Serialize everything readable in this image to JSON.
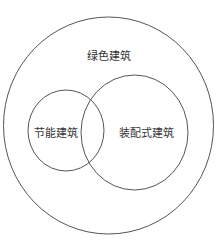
{
  "diagram": {
    "type": "venn",
    "outer": {
      "label": "绿色建筑",
      "cx": 108.5,
      "cy": 125.5,
      "rx": 105,
      "ry": 108.5,
      "label_x": 109,
      "label_y": 55
    },
    "left": {
      "label": "节能建筑",
      "cx": 66,
      "cy": 130.5,
      "rx": 38,
      "ry": 40.5,
      "label_x": 56,
      "label_y": 132
    },
    "right": {
      "label": "装配式建筑",
      "cx": 134.5,
      "cy": 132.5,
      "rx": 53.5,
      "ry": 57.5,
      "label_x": 146,
      "label_y": 132
    },
    "stroke": "#555555"
  }
}
